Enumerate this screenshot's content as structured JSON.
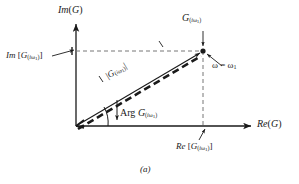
{
  "figure": {
    "caption": "(a)",
    "axes": {
      "imaginary_axis_label": "Im (G)",
      "real_axis_label": "Re (G)"
    },
    "labels": {
      "imaginary_projection": "Im [G(iω₁)]",
      "real_projection": "Re [G(iω₁)]",
      "point_label": "G(iω₁)",
      "frequency_marker": "ω = ω₁",
      "magnitude": "|G(iω₁)|",
      "argument": "Arg G(iω₁)"
    },
    "parts": {
      "im_main": "Im",
      "im_bracket_open": "[",
      "im_bracket_close": "]",
      "re_main": "Re",
      "re_bracket_open": "[",
      "re_bracket_close": "]",
      "g_symbol": "G",
      "paren_open": "(",
      "paren_close": ")",
      "i_symbol": "i",
      "omega_symbol": "ω",
      "one_symbol": "1",
      "equals_symbol": "=",
      "bar_symbol": "|",
      "arg_word": "Arg",
      "im_axis_main": "Im",
      "re_axis_main": "Re",
      "g_plain": "G"
    },
    "colors": {
      "ink": "#1a1a1a",
      "background": "#ffffff",
      "dashed_guide": "#777777"
    },
    "geometry": {
      "origin": [
        76,
        126
      ],
      "point": [
        203,
        51
      ],
      "im_axis_top": [
        76,
        22
      ],
      "re_axis_right": [
        253,
        126
      ],
      "angle_degrees": 30.5
    }
  }
}
